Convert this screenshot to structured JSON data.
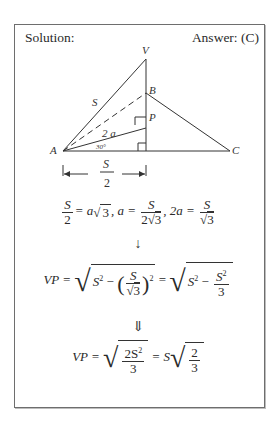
{
  "header": {
    "solution_label": "Solution:",
    "answer_label": "Answer: (C)"
  },
  "diagram": {
    "vertices": {
      "V": "V",
      "B": "B",
      "P": "P",
      "A": "A",
      "C": "C"
    },
    "side_label_S": "S",
    "segment_label_2a": "2 a",
    "angle_label": "30°",
    "dimension": {
      "numerator": "S",
      "denominator": "2"
    }
  },
  "equations": {
    "line1": {
      "lhs_num": "S",
      "lhs_den": "2",
      "eq1": "= a",
      "sqrt1": "3",
      "sep1": ",  a =",
      "f2_num": "S",
      "f2_den_coef": "2",
      "f2_den_sqrt": "3",
      "sep2": ",  2a =",
      "f3_num": "S",
      "f3_den_sqrt": "3"
    },
    "arrow1": "↓",
    "line2": {
      "lhs": "VP =",
      "s2": "S",
      "exp": "2",
      "minus": " − ",
      "inner_num": "S",
      "inner_den_sqrt": "3",
      "eq": " = ",
      "s2b": "S",
      "minus2": " − ",
      "f_num": "S",
      "f_den": "3"
    },
    "arrow2": "⇓",
    "line3": {
      "lhs": "VP =",
      "num": "2S",
      "exp": "2",
      "den": "3",
      "eq": " = S",
      "f_num": "2",
      "f_den": "3"
    }
  }
}
